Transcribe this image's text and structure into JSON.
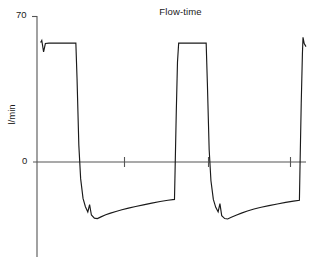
{
  "chart_data": {
    "type": "line",
    "title": "Flow-time",
    "xlabel": "",
    "ylabel": "l/min",
    "y_tick_labels": [
      "70",
      "0"
    ],
    "y_tick_values": [
      70,
      0
    ],
    "ylim": [
      -40,
      70
    ],
    "xlim": [
      0,
      9
    ],
    "grid": false,
    "legend": false,
    "axis_style": "zero-line horizontal axis with unlabeled ticks, vertical y-axis on left",
    "x_tick_values": [
      3,
      6,
      9
    ],
    "x_tick_labels": [
      "",
      "",
      ""
    ],
    "line_color": "#1a1a1a",
    "axis_color": "#555555",
    "series": [
      {
        "name": "Flow",
        "points": [
          [
            0.12,
            57.5
          ],
          [
            0.16,
            58.5
          ],
          [
            0.22,
            53.0
          ],
          [
            0.28,
            57.0
          ],
          [
            0.4,
            57.2
          ],
          [
            1.2,
            57.2
          ],
          [
            1.3,
            57.2
          ],
          [
            1.34,
            40.0
          ],
          [
            1.4,
            8.0
          ],
          [
            1.46,
            -8.0
          ],
          [
            1.54,
            -17.5
          ],
          [
            1.62,
            -21.5
          ],
          [
            1.7,
            -24.0
          ],
          [
            1.76,
            -20.5
          ],
          [
            1.82,
            -25.5
          ],
          [
            1.92,
            -27.0
          ],
          [
            2.02,
            -27.2
          ],
          [
            2.14,
            -26.4
          ],
          [
            2.3,
            -25.4
          ],
          [
            2.46,
            -24.6
          ],
          [
            2.64,
            -23.8
          ],
          [
            2.84,
            -23.0
          ],
          [
            3.06,
            -22.2
          ],
          [
            3.3,
            -21.4
          ],
          [
            3.56,
            -20.6
          ],
          [
            3.84,
            -19.8
          ],
          [
            4.12,
            -19.0
          ],
          [
            4.38,
            -18.4
          ],
          [
            4.6,
            -18.0
          ],
          [
            4.62,
            -4.0
          ],
          [
            4.66,
            24.0
          ],
          [
            4.7,
            48.0
          ],
          [
            4.74,
            57.2
          ],
          [
            5.1,
            57.2
          ],
          [
            5.6,
            57.2
          ],
          [
            5.66,
            57.2
          ],
          [
            5.7,
            38.0
          ],
          [
            5.76,
            6.0
          ],
          [
            5.82,
            -9.0
          ],
          [
            5.9,
            -18.0
          ],
          [
            5.98,
            -21.8
          ],
          [
            6.06,
            -24.0
          ],
          [
            6.12,
            -20.0
          ],
          [
            6.18,
            -25.8
          ],
          [
            6.28,
            -27.2
          ],
          [
            6.38,
            -27.4
          ],
          [
            6.5,
            -26.6
          ],
          [
            6.66,
            -25.6
          ],
          [
            6.84,
            -24.6
          ],
          [
            7.04,
            -23.6
          ],
          [
            7.26,
            -22.6
          ],
          [
            7.5,
            -21.8
          ],
          [
            7.76,
            -21.0
          ],
          [
            8.04,
            -20.2
          ],
          [
            8.32,
            -19.4
          ],
          [
            8.58,
            -18.8
          ],
          [
            8.78,
            -18.4
          ],
          [
            8.8,
            -2.0
          ],
          [
            8.84,
            28.0
          ],
          [
            8.88,
            52.0
          ],
          [
            8.9,
            60.0
          ],
          [
            8.94,
            57.0
          ],
          [
            9.0,
            55.5
          ]
        ]
      }
    ]
  }
}
